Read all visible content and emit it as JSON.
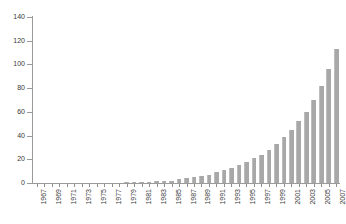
{
  "chart_data": {
    "type": "bar",
    "title": "",
    "subtitle": "",
    "xlabel": "",
    "ylabel": "",
    "ylim": [
      0,
      140
    ],
    "y_ticks": [
      0,
      20,
      40,
      60,
      80,
      100,
      120,
      140
    ],
    "grid": false,
    "legend": null,
    "bar_color": "#a8a8a8",
    "axis_color": "#9a9a9a",
    "text_color": "#3a3a3a",
    "background": "#ffffff",
    "x_tick_label_interval": 2,
    "categories": [
      "1967",
      "1968",
      "1969",
      "1970",
      "1971",
      "1972",
      "1973",
      "1974",
      "1975",
      "1976",
      "1977",
      "1978",
      "1979",
      "1980",
      "1981",
      "1982",
      "1983",
      "1984",
      "1985",
      "1986",
      "1987",
      "1988",
      "1989",
      "1990",
      "1991",
      "1992",
      "1993",
      "1994",
      "1995",
      "1996",
      "1997",
      "1998",
      "1999",
      "2000",
      "2001",
      "2002",
      "2003",
      "2004",
      "2005",
      "2006",
      "2007"
    ],
    "values": [
      0,
      0,
      0,
      0,
      0,
      0,
      0,
      0,
      0,
      0,
      0,
      0,
      1,
      1,
      1,
      1,
      2,
      2,
      2,
      3,
      4,
      5,
      6,
      7,
      9,
      11,
      13,
      15,
      18,
      21,
      24,
      28,
      33,
      39,
      45,
      52,
      60,
      70,
      82,
      96,
      113
    ],
    "tick_labels_visible": [
      "1967",
      "1969",
      "1971",
      "1973",
      "1975",
      "1977",
      "1979",
      "1981",
      "1983",
      "1985",
      "1987",
      "1989",
      "1991",
      "1993",
      "1995",
      "1997",
      "1999",
      "2001",
      "2003",
      "2005",
      "2007"
    ]
  }
}
